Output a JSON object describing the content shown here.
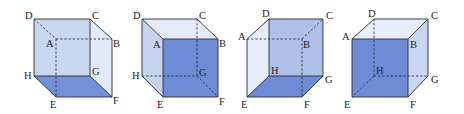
{
  "figure": {
    "colors": {
      "dark_face": "#6f8bd6",
      "mid_face": "#aebfe8",
      "light_face": "#cdd9f1",
      "pale_face": "#e3eaf7",
      "edge": "#2b2b35"
    },
    "cubes": [
      {
        "id": 1,
        "shaded_face": "EFGH (bottom)",
        "labels": {
          "A": "A",
          "B": "B",
          "C": "C",
          "D": "D",
          "E": "E",
          "F": "F",
          "G": "G",
          "H": "H"
        }
      },
      {
        "id": 2,
        "shaded_face": "ABFE (front)",
        "labels": {
          "A": "A",
          "B": "B",
          "C": "C",
          "D": "D",
          "E": "E",
          "F": "F",
          "G": "G",
          "H": "H"
        }
      },
      {
        "id": 3,
        "shaded_face": "EFGH (bottom)",
        "labels": {
          "A": "A",
          "B": "B",
          "C": "C",
          "D": "D",
          "E": "E",
          "F": "F",
          "G": "G",
          "H": "H"
        }
      },
      {
        "id": 4,
        "shaded_face": "AEFB (front)",
        "labels": {
          "A": "A",
          "B": "B",
          "C": "C",
          "D": "D",
          "E": "E",
          "F": "F",
          "G": "G",
          "H": "H"
        }
      }
    ]
  }
}
